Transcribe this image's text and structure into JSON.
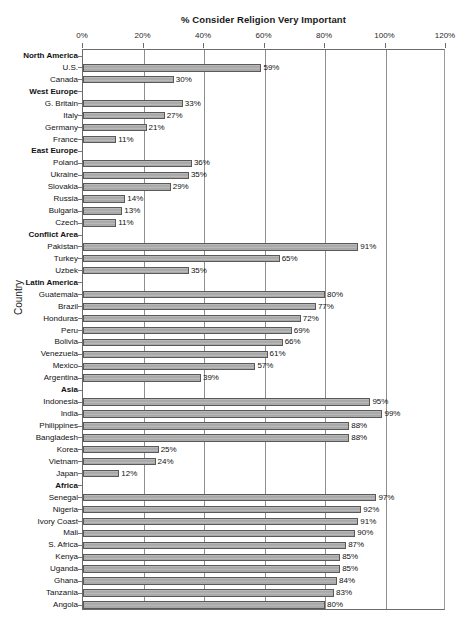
{
  "chart_data": {
    "type": "bar",
    "orientation": "horizontal",
    "title": "% Consider Religion Very Important",
    "xlabel": "",
    "ylabel": "Country",
    "xlim": [
      0,
      120
    ],
    "xticks": [
      "0%",
      "20%",
      "40%",
      "60%",
      "80%",
      "100%",
      "120%"
    ],
    "xtick_values": [
      0,
      20,
      40,
      60,
      80,
      100,
      120
    ],
    "grid": true,
    "legend": "none",
    "value_suffix": "%",
    "categories": [
      "North America",
      "U.S.",
      "Canada",
      "West Europe",
      "G. Britain",
      "Italy",
      "Germany",
      "France",
      "East Europe",
      "Poland",
      "Ukraine",
      "Slovakia",
      "Russia",
      "Bulgaria",
      "Czech",
      "Conflict Area",
      "Pakistan",
      "Turkey",
      "Uzbek",
      "Latin America",
      "Guatemala",
      "Brazil",
      "Honduras",
      "Peru",
      "Bolivia",
      "Venezuela",
      "Mexico",
      "Argentina",
      "Asia",
      "Indonesia",
      "India",
      "Philippines",
      "Bangladesh",
      "Korea",
      "Vietnam",
      "Japan",
      "Africa",
      "Senegal",
      "Nigeria",
      "Ivory Coast",
      "Mali",
      "S. Africa",
      "Kenya",
      "Uganda",
      "Ghana",
      "Tanzania",
      "Angola"
    ],
    "rows": [
      {
        "label": "North America",
        "group": true,
        "value": null,
        "value_label": ""
      },
      {
        "label": "U.S.",
        "group": false,
        "value": 59,
        "value_label": "59%"
      },
      {
        "label": "Canada",
        "group": false,
        "value": 30,
        "value_label": "30%"
      },
      {
        "label": "West Europe",
        "group": true,
        "value": null,
        "value_label": ""
      },
      {
        "label": "G. Britain",
        "group": false,
        "value": 33,
        "value_label": "33%"
      },
      {
        "label": "Italy",
        "group": false,
        "value": 27,
        "value_label": "27%"
      },
      {
        "label": "Germany",
        "group": false,
        "value": 21,
        "value_label": "21%"
      },
      {
        "label": "France",
        "group": false,
        "value": 11,
        "value_label": "11%"
      },
      {
        "label": "East Europe",
        "group": true,
        "value": null,
        "value_label": ""
      },
      {
        "label": "Poland",
        "group": false,
        "value": 36,
        "value_label": "36%"
      },
      {
        "label": "Ukraine",
        "group": false,
        "value": 35,
        "value_label": "35%"
      },
      {
        "label": "Slovakia",
        "group": false,
        "value": 29,
        "value_label": "29%"
      },
      {
        "label": "Russia",
        "group": false,
        "value": 14,
        "value_label": "14%"
      },
      {
        "label": "Bulgaria",
        "group": false,
        "value": 13,
        "value_label": "13%"
      },
      {
        "label": "Czech",
        "group": false,
        "value": 11,
        "value_label": "11%"
      },
      {
        "label": "Conflict Area",
        "group": true,
        "value": null,
        "value_label": ""
      },
      {
        "label": "Pakistan",
        "group": false,
        "value": 91,
        "value_label": "91%"
      },
      {
        "label": "Turkey",
        "group": false,
        "value": 65,
        "value_label": "65%"
      },
      {
        "label": "Uzbek",
        "group": false,
        "value": 35,
        "value_label": "35%"
      },
      {
        "label": "Latin America",
        "group": true,
        "value": null,
        "value_label": ""
      },
      {
        "label": "Guatemala",
        "group": false,
        "value": 80,
        "value_label": "80%"
      },
      {
        "label": "Brazil",
        "group": false,
        "value": 77,
        "value_label": "77%"
      },
      {
        "label": "Honduras",
        "group": false,
        "value": 72,
        "value_label": "72%"
      },
      {
        "label": "Peru",
        "group": false,
        "value": 69,
        "value_label": "69%"
      },
      {
        "label": "Bolivia",
        "group": false,
        "value": 66,
        "value_label": "66%"
      },
      {
        "label": "Venezuela",
        "group": false,
        "value": 61,
        "value_label": "61%"
      },
      {
        "label": "Mexico",
        "group": false,
        "value": 57,
        "value_label": "57%"
      },
      {
        "label": "Argentina",
        "group": false,
        "value": 39,
        "value_label": "39%"
      },
      {
        "label": "Asia",
        "group": true,
        "value": null,
        "value_label": ""
      },
      {
        "label": "Indonesia",
        "group": false,
        "value": 95,
        "value_label": "95%"
      },
      {
        "label": "India",
        "group": false,
        "value": 99,
        "value_label": "99%"
      },
      {
        "label": "Philippines",
        "group": false,
        "value": 88,
        "value_label": "88%"
      },
      {
        "label": "Bangladesh",
        "group": false,
        "value": 88,
        "value_label": "88%"
      },
      {
        "label": "Korea",
        "group": false,
        "value": 25,
        "value_label": "25%"
      },
      {
        "label": "Vietnam",
        "group": false,
        "value": 24,
        "value_label": "24%"
      },
      {
        "label": "Japan",
        "group": false,
        "value": 12,
        "value_label": "12%"
      },
      {
        "label": "Africa",
        "group": true,
        "value": null,
        "value_label": ""
      },
      {
        "label": "Senegal",
        "group": false,
        "value": 97,
        "value_label": "97%"
      },
      {
        "label": "Nigeria",
        "group": false,
        "value": 92,
        "value_label": "92%"
      },
      {
        "label": "Ivory Coast",
        "group": false,
        "value": 91,
        "value_label": "91%"
      },
      {
        "label": "Mali",
        "group": false,
        "value": 90,
        "value_label": "90%"
      },
      {
        "label": "S. Africa",
        "group": false,
        "value": 87,
        "value_label": "87%"
      },
      {
        "label": "Kenya",
        "group": false,
        "value": 85,
        "value_label": "85%"
      },
      {
        "label": "Uganda",
        "group": false,
        "value": 85,
        "value_label": "85%"
      },
      {
        "label": "Ghana",
        "group": false,
        "value": 84,
        "value_label": "84%"
      },
      {
        "label": "Tanzania",
        "group": false,
        "value": 83,
        "value_label": "83%"
      },
      {
        "label": "Angola",
        "group": false,
        "value": 80,
        "value_label": "80%"
      }
    ],
    "colors": {
      "bar_fill": "#b0b0b0",
      "bar_border": "#595959",
      "gridline": "#8e8e8e",
      "axis": "#6b6b6b",
      "text": "#111111",
      "background": "#ffffff"
    }
  }
}
